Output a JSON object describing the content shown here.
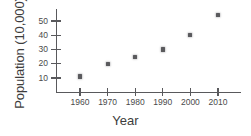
{
  "chart_data": {
    "type": "scatter",
    "title": "",
    "xlabel": "Year",
    "ylabel": "Population (10,000)",
    "categories": [
      "1960",
      "1970",
      "1980",
      "1990",
      "2000",
      "2010"
    ],
    "x": [
      1960,
      1970,
      1980,
      1990,
      2000,
      2010
    ],
    "values": [
      11,
      20,
      25,
      30,
      40,
      54
    ],
    "series": [
      {
        "name": "Population",
        "values": [
          11,
          20,
          25,
          30,
          40,
          54
        ]
      }
    ],
    "xtick_labels": [
      "1960",
      "1970",
      "1980",
      "1990",
      "2000",
      "2010"
    ],
    "ytick_labels": [
      "10",
      "20",
      "30",
      "40",
      "50"
    ],
    "ytick_values": [
      10,
      20,
      30,
      40,
      50
    ],
    "xlim": [
      1952,
      2018
    ],
    "ylim": [
      0,
      59
    ],
    "grid": false,
    "legend": false,
    "marker_color": "#5a5a5d",
    "axis_color": "#59595c",
    "background_color": "#ffffff"
  },
  "axes": {
    "y_label": "Population (10,000)",
    "x_label": "Year"
  },
  "yticks": [
    {
      "label": "50",
      "value": 50
    },
    {
      "label": "40",
      "value": 40
    },
    {
      "label": "30",
      "value": 30
    },
    {
      "label": "20",
      "value": 20
    },
    {
      "label": "10",
      "value": 10
    }
  ],
  "xticks": [
    {
      "label": "1960",
      "value": 1960
    },
    {
      "label": "1970",
      "value": 1970
    },
    {
      "label": "1980",
      "value": 1980
    },
    {
      "label": "1990",
      "value": 1990
    },
    {
      "label": "2000",
      "value": 2000
    },
    {
      "label": "2010",
      "value": 2010
    }
  ],
  "points": [
    {
      "x": 1960,
      "y": 11
    },
    {
      "x": 1970,
      "y": 20
    },
    {
      "x": 1980,
      "y": 25
    },
    {
      "x": 1990,
      "y": 30
    },
    {
      "x": 2000,
      "y": 40
    },
    {
      "x": 2010,
      "y": 54
    }
  ]
}
